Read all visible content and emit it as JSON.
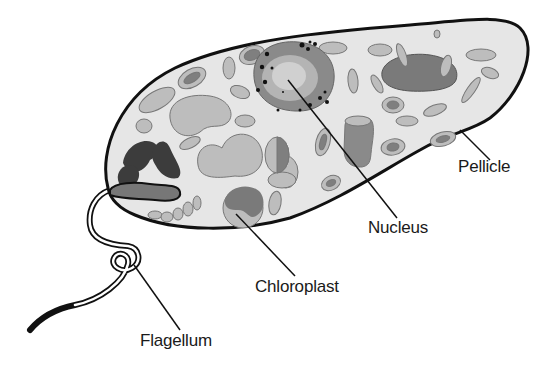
{
  "diagram": {
    "labels": {
      "pellicle": "Pellicle",
      "nucleus": "Nucleus",
      "chloroplast": "Chloroplast",
      "flagellum": "Flagellum"
    }
  },
  "colors": {
    "outline": "#111111",
    "cytoplasm": "#e6e6e6",
    "organelle_light": "#bdbdbd",
    "organelle_mid": "#9c9c9c",
    "organelle_dark": "#6f6f6f",
    "eyespot": "#3c3c3c",
    "nucleus_outer": "#8a8a8a",
    "nucleus_mid": "#b4b4b4",
    "nucleus_inner": "#d0d0d0",
    "background": "#ffffff"
  }
}
